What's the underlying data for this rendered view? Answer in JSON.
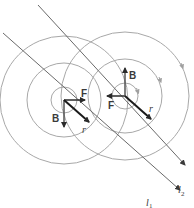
{
  "diagram": {
    "colors": {
      "circle": "#a8a8a8",
      "wire": "#6a6a6a",
      "vector": "#2a2a2a",
      "label": "#3a3a3a"
    },
    "wires": [
      {
        "name": "l1",
        "label": "l",
        "subscript": "1",
        "x1": 3,
        "y1": 33,
        "x2": 180,
        "y2": 190
      },
      {
        "name": "l2",
        "label": "l",
        "subscript": "2",
        "x1": 38,
        "y1": 5,
        "x2": 185,
        "y2": 165
      }
    ],
    "field_circles": [
      {
        "wire": "l1",
        "cx": 64,
        "cy": 100,
        "radii": [
          13,
          37,
          64
        ]
      },
      {
        "wire": "l2",
        "cx": 125,
        "cy": 96,
        "radii": [
          13,
          37,
          64
        ]
      }
    ],
    "vectors": {
      "left": {
        "force_label": "F",
        "field_label": "B",
        "position_label": "r"
      },
      "right": {
        "force_label": "F",
        "field_label": "B",
        "position_label": "r"
      }
    }
  }
}
